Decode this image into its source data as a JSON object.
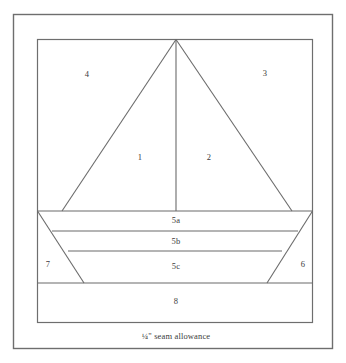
{
  "diagram": {
    "caption": "¼\" seam allowance",
    "colors": {
      "background": "#ffffff",
      "outer_border": "#6e6e6e",
      "inner_border": "#6e6e6e",
      "piece_line": "#6b6b6b",
      "label_text": "#3b3b3b"
    },
    "pieces": [
      {
        "id": "1",
        "label": "1",
        "region": "left-sail",
        "x": 140,
        "y": 158
      },
      {
        "id": "2",
        "label": "2",
        "region": "right-sail",
        "x": 209,
        "y": 158
      },
      {
        "id": "3",
        "label": "3",
        "region": "upper-right-background",
        "x": 265,
        "y": 74
      },
      {
        "id": "4",
        "label": "4",
        "region": "upper-left-background",
        "x": 87,
        "y": 75
      },
      {
        "id": "5a",
        "label": "5a",
        "region": "hull-stripe-top",
        "x": 176,
        "y": 221
      },
      {
        "id": "5b",
        "label": "5b",
        "region": "hull-stripe-middle",
        "x": 176,
        "y": 242
      },
      {
        "id": "5c",
        "label": "5c",
        "region": "hull-stripe-bottom",
        "x": 176,
        "y": 267
      },
      {
        "id": "6",
        "label": "6",
        "region": "lower-right-background",
        "x": 303,
        "y": 265
      },
      {
        "id": "7",
        "label": "7",
        "region": "lower-left-background",
        "x": 48,
        "y": 265
      },
      {
        "id": "8",
        "label": "8",
        "region": "water-bottom-strip",
        "x": 176,
        "y": 302
      }
    ],
    "geometry": {
      "outer_border": {
        "x": 13,
        "y": 14,
        "width": 320,
        "height": 335
      },
      "inner_block": {
        "x": 37,
        "y": 39,
        "width": 276,
        "height": 284
      },
      "mast_apex": {
        "x": 176,
        "y": 39
      },
      "mast_base": {
        "x": 176,
        "y": 211
      },
      "left_sail_base": {
        "x": 62,
        "y": 211
      },
      "right_sail_base": {
        "x": 292,
        "y": 211
      },
      "hull_top_y": 211,
      "stripe_b_y": 231,
      "stripe_c_y": 251,
      "hull_bottom_y": 283,
      "hull_left_bottom_x": 84,
      "hull_right_bottom_x": 267,
      "stripe_b_left_x": 52,
      "stripe_b_right_x": 298,
      "stripe_c_left_x": 68,
      "stripe_c_right_x": 282
    }
  }
}
